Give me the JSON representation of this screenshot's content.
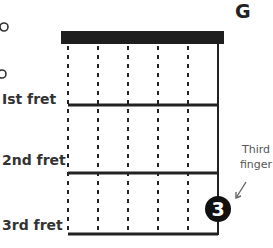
{
  "chord": {
    "name": "G",
    "open_string_marker": "o",
    "open_markers": [
      {
        "x": 4,
        "y": 27
      },
      {
        "x": 2,
        "y": 74
      }
    ]
  },
  "frets": [
    {
      "label": "Ist fret",
      "y": 105
    },
    {
      "label": "2nd fret",
      "y": 173
    },
    {
      "label": "3rd fret",
      "y": 234
    }
  ],
  "strings_count": 6,
  "finger_marker": {
    "number": "3",
    "string_index": 5,
    "fret": 3
  },
  "annotation": {
    "line1": "Third",
    "line2": "finger"
  },
  "colors": {
    "nut": "#1e1e1e",
    "line": "#222222",
    "finger_fill": "#111111",
    "finger_text": "#ffffff",
    "arrow": "#666666"
  }
}
